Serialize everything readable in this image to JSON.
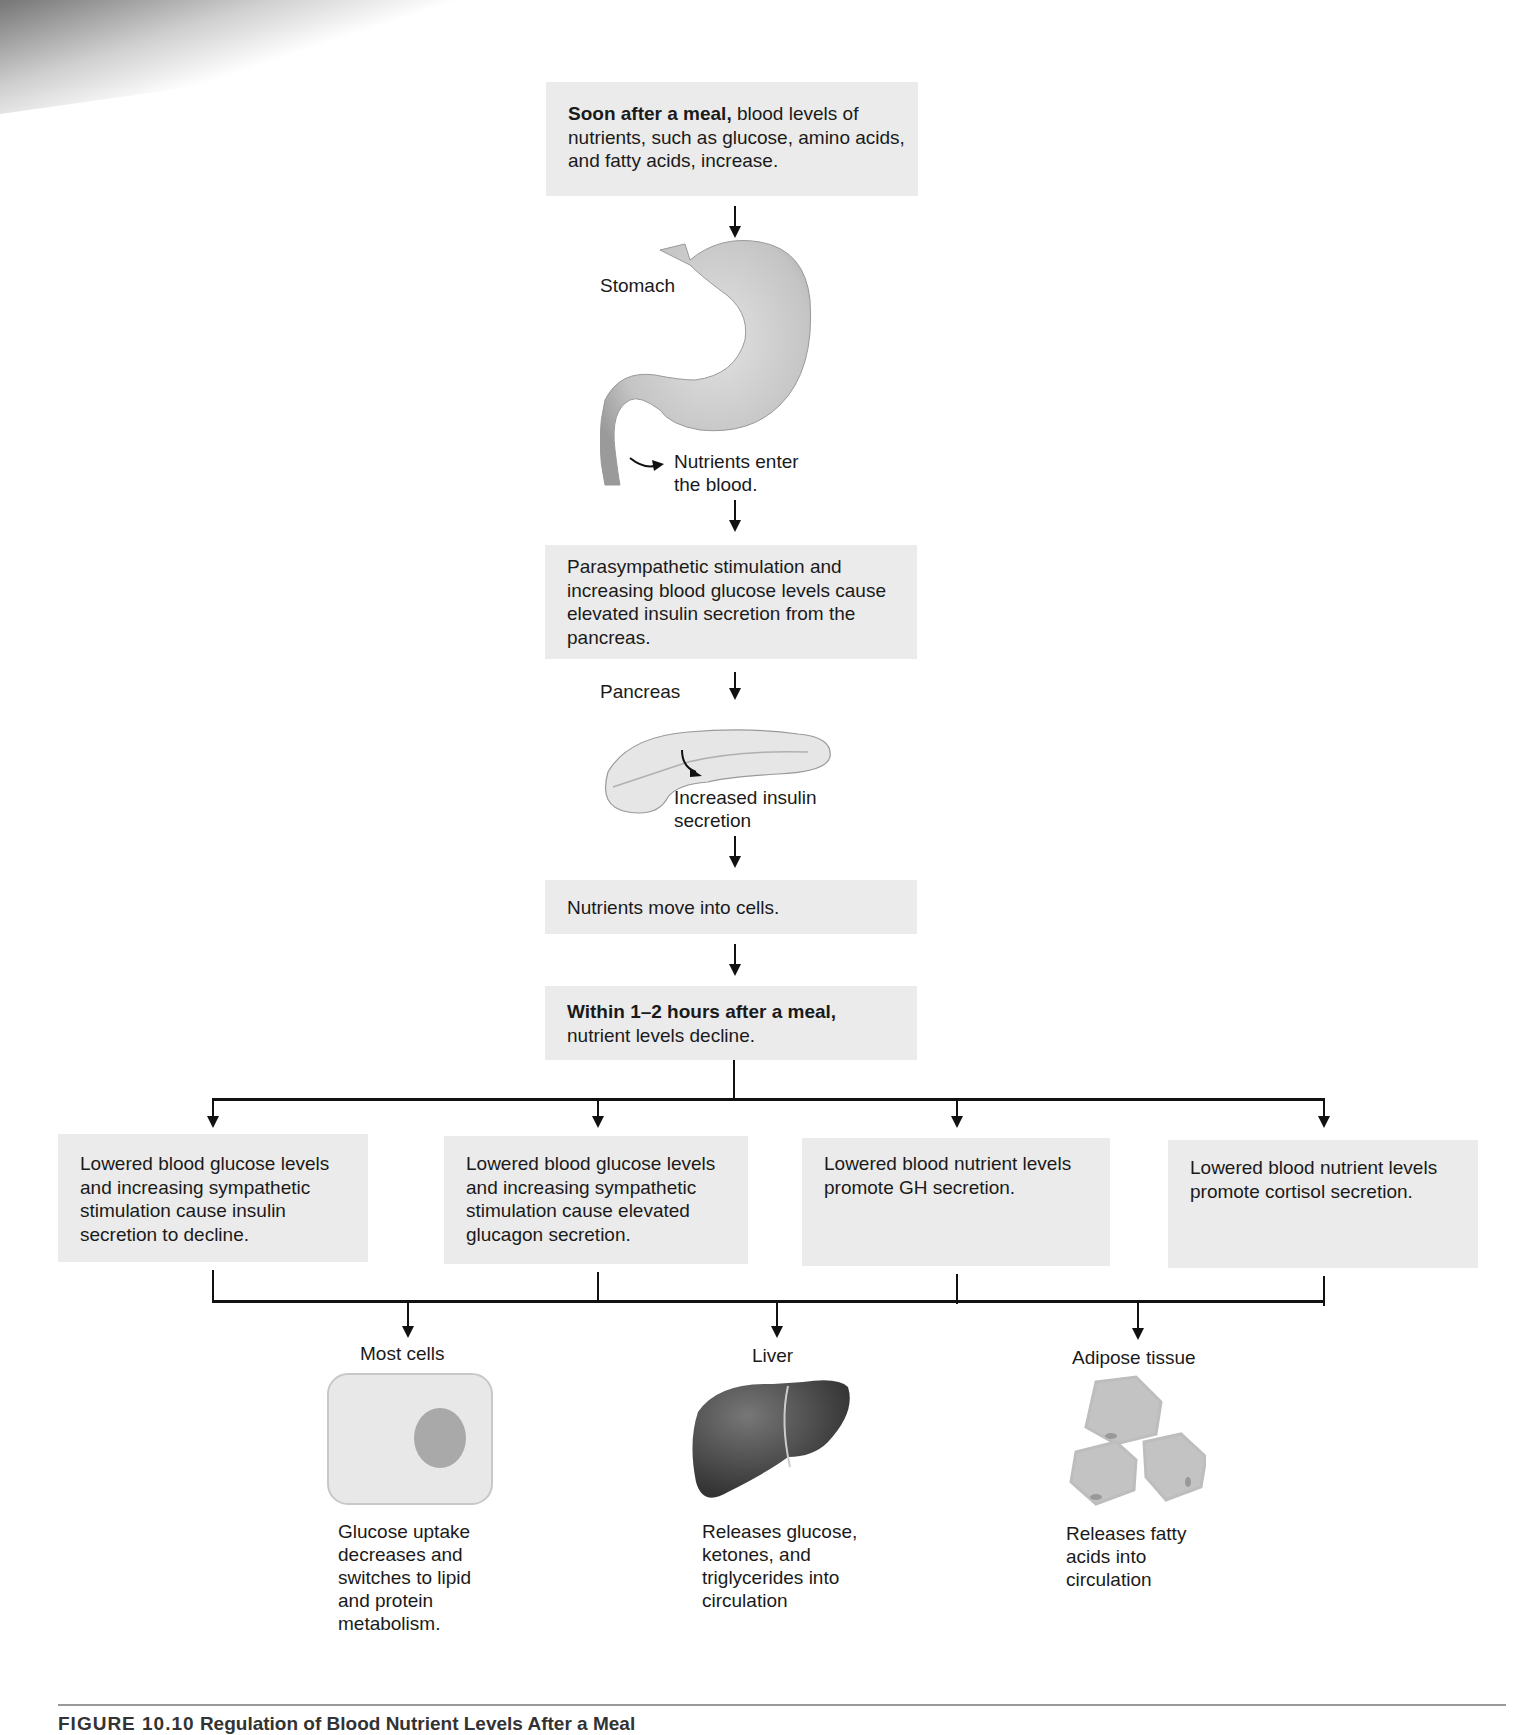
{
  "figure": {
    "caption_number": "FIGURE 10.10",
    "caption_title": "Regulation of Blood Nutrient Levels After a Meal"
  },
  "flow": {
    "step1": {
      "bold": "Soon after a meal,",
      "text": " blood levels of nutrients, such as glucose, amino acids, and fatty acids, increase."
    },
    "stomach_label": "Stomach",
    "nutrients_enter": "Nutrients enter the blood.",
    "step2": {
      "text": "Parasympathetic stimulation and increasing blood glucose levels cause elevated insulin secretion from the pancreas."
    },
    "pancreas_label": "Pancreas",
    "insulin_label": "Increased insulin secretion",
    "step3": {
      "text": "Nutrients move into cells."
    },
    "step4": {
      "bold": "Within 1–2 hours after a meal,",
      "text": "nutrient levels decline."
    }
  },
  "branches": [
    {
      "text": "Lowered blood glucose levels and increasing sympathetic stimulation cause insulin secretion to decline."
    },
    {
      "text": "Lowered blood glucose levels and increasing sympathetic stimulation cause elevated glucagon secretion."
    },
    {
      "text": "Lowered blood nutrient levels promote GH secretion."
    },
    {
      "text": "Lowered blood nutrient levels promote cortisol secretion."
    }
  ],
  "targets": [
    {
      "label": "Most cells",
      "effect": "Glucose uptake decreases and switches to lipid and protein metabolism."
    },
    {
      "label": "Liver",
      "effect": "Releases glucose, ketones, and triglycerides into circulation"
    },
    {
      "label": "Adipose tissue",
      "effect": "Releases fatty acids into circulation"
    }
  ]
}
